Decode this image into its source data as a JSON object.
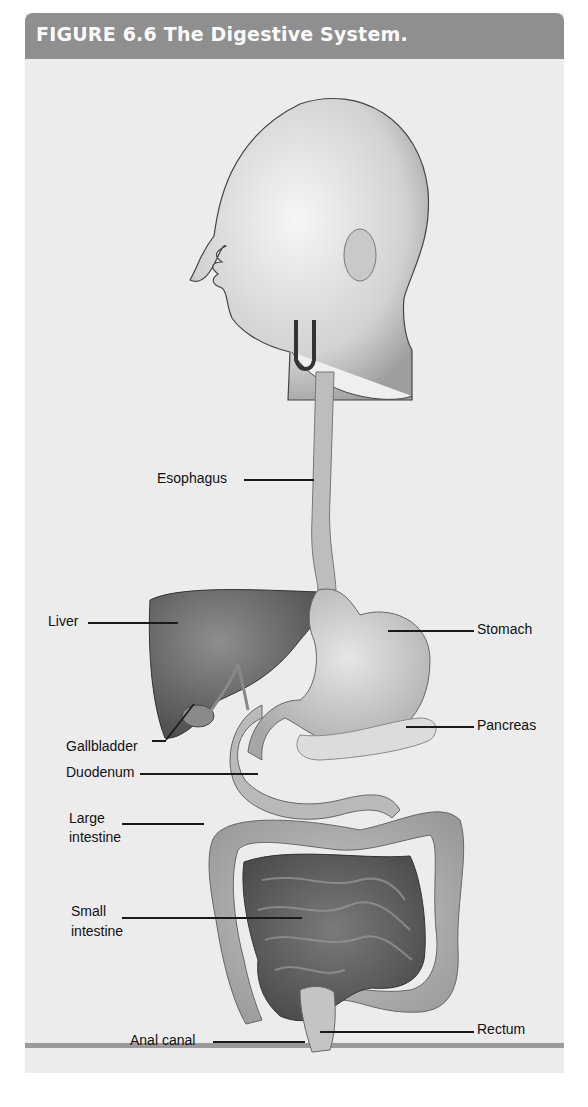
{
  "figure": {
    "number": "FIGURE 6.6",
    "title": "FIGURE 6.6  The Digestive System.",
    "colors": {
      "header_bg": "#8f8f8f",
      "header_text": "#fafafa",
      "panel_bg": "#ececec",
      "organ_fill": "#b8b8b8",
      "organ_dark": "#6e6e6e",
      "label_text": "#111111"
    },
    "labels": {
      "esophagus": "Esophagus",
      "liver": "Liver",
      "stomach": "Stomach",
      "pancreas": "Pancreas",
      "gallbladder": "Gallbladder",
      "duodenum": "Duodenum",
      "large_intestine_1": "Large",
      "large_intestine_2": "intestine",
      "small_intestine_1": "Small",
      "small_intestine_2": "intestine",
      "anal_canal": "Anal canal",
      "rectum": "Rectum"
    }
  }
}
